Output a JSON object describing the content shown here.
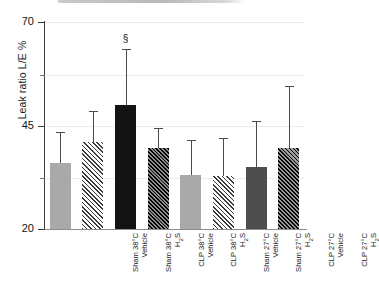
{
  "chart_data": {
    "type": "bar",
    "title": "",
    "xlabel": "",
    "ylabel": "Leak ratio L/E %",
    "ylim": [
      20,
      70
    ],
    "yticks": [
      20,
      45,
      70
    ],
    "ytick_labels": [
      "20",
      "45",
      "70"
    ],
    "yminor_ticks": [
      32.5,
      57.5
    ],
    "grid": "horizontal-light",
    "legend": "none",
    "categories": [
      "Sham 38°C Vehicle",
      "Sham 38°C H2S",
      "CLP 38°C Vehicle",
      "CLP 38°C H2S",
      "Sham 27°C Vehicle",
      "Sham 27°C H2S",
      "CLP 27°C Vehicle",
      "CLP 27°C H2S"
    ],
    "values": [
      36.0,
      41.0,
      50.0,
      39.5,
      33.0,
      32.8,
      35.0,
      39.5
    ],
    "error_upper": [
      43.5,
      48.5,
      63.5,
      44.5,
      41.5,
      42.0,
      46.0,
      54.5
    ],
    "annotations": [
      {
        "bar_index": 2,
        "text": "§"
      }
    ],
    "bar_styles": [
      "solid-light-gray",
      "hatched-light",
      "solid-black",
      "hatched-black",
      "solid-light-gray",
      "hatched-light",
      "solid-dark-gray",
      "hatched-dark"
    ],
    "colors": {
      "light_gray": "#a9a9a9",
      "black": "#131313",
      "dark_gray": "#4e4e4e",
      "axis": "#3b3b3b",
      "grid": "#ececec",
      "error_bar": "#4b4b4b",
      "text": "#131313"
    }
  },
  "bars": [
    {
      "line1": "Sham 38°C",
      "line2_pre": "Vehicle",
      "line2_sub": "",
      "line2_post": ""
    },
    {
      "line1": "Sham 38°C",
      "line2_pre": "H",
      "line2_sub": "2",
      "line2_post": "S"
    },
    {
      "line1": "CLP 38°C",
      "line2_pre": "Vehicle",
      "line2_sub": "",
      "line2_post": ""
    },
    {
      "line1": "CLP 38°C",
      "line2_pre": "H",
      "line2_sub": "2",
      "line2_post": "S"
    },
    {
      "line1": "Sham 27°C",
      "line2_pre": "Vehicle",
      "line2_sub": "",
      "line2_post": ""
    },
    {
      "line1": "Sham 27°C",
      "line2_pre": "H",
      "line2_sub": "2",
      "line2_post": "S"
    },
    {
      "line1": "CLP 27°C",
      "line2_pre": "Vehicle",
      "line2_sub": "",
      "line2_post": ""
    },
    {
      "line1": "CLP 27°C",
      "line2_pre": "H",
      "line2_sub": "2",
      "line2_post": "S"
    }
  ],
  "axis": {
    "y_title": "Leak ratio L/E %",
    "tick_top": "70",
    "tick_mid": "45",
    "tick_bottom": "20"
  },
  "marks": {
    "section_sign": "§"
  }
}
